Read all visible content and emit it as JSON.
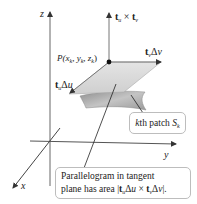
{
  "figure": {
    "axes": {
      "x_label": "x",
      "y_label": "y",
      "z_label": "z"
    },
    "point": {
      "label_prefix": "P(",
      "x": "x",
      "x_sub": "k",
      "y": "y",
      "y_sub": "k",
      "z": "z",
      "z_sub": "k",
      "suffix": ")"
    },
    "vectors": {
      "normal": {
        "t1": "t",
        "t1_sub": "u",
        "op": " × ",
        "t2": "t",
        "t2_sub": "v"
      },
      "tv": {
        "t": "t",
        "sub": "v",
        "delta": "Δ",
        "var": "v"
      },
      "tu": {
        "t": "t",
        "sub": "u",
        "delta": "Δ",
        "var": "u"
      }
    },
    "callouts": {
      "patch": {
        "prefix": "k",
        "text": "th patch ",
        "S": "S",
        "S_sub": "k"
      },
      "parallelogram": {
        "line1": "Parallelogram in tangent",
        "line2_prefix": "plane has area |",
        "t1": "t",
        "t1_sub": "u",
        "d1": "Δ",
        "v1": "u",
        "op": " × ",
        "t2": "t",
        "t2_sub": "v",
        "d2": "Δ",
        "v2": "v",
        "line2_suffix": "|."
      }
    },
    "colors": {
      "axis": "#555555",
      "plane": "#d6d6d6",
      "surface": "#a8a8a8",
      "callout_border": "#bdbdbd"
    }
  }
}
